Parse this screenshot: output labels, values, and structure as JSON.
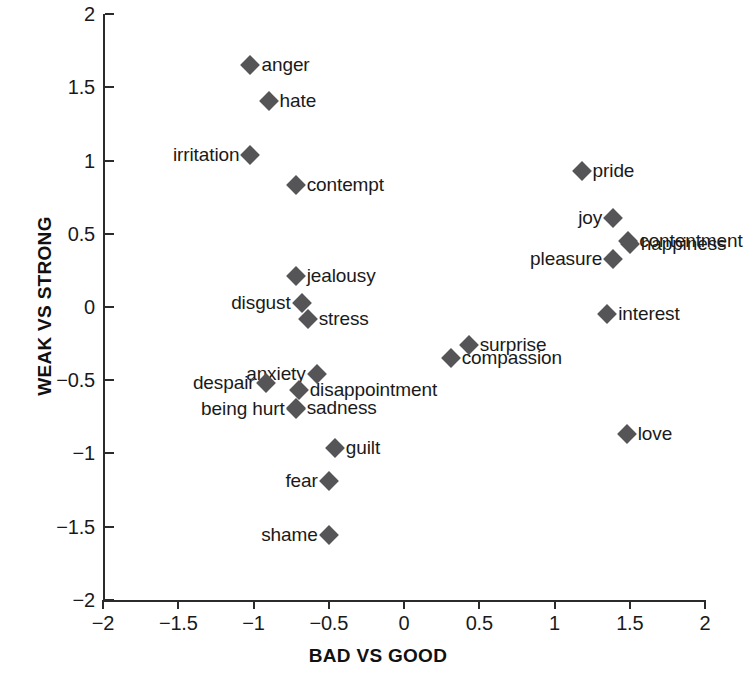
{
  "chart_data": {
    "type": "scatter",
    "title": "",
    "xlabel": "BAD VS GOOD",
    "ylabel": "WEAK VS STRONG",
    "xlim": [
      -2,
      2
    ],
    "ylim": [
      -2,
      2
    ],
    "xticks": [
      "-2",
      "-1.5",
      "-1",
      "-0.5",
      "0",
      "0.5",
      "1",
      "1.5",
      "2"
    ],
    "xtick_values": [
      -2,
      -1.5,
      -1,
      -0.5,
      0,
      0.5,
      1,
      1.5,
      2
    ],
    "yticks": [
      "2",
      "1.5",
      "1",
      "0.5",
      "0",
      "-0.5",
      "-1",
      "-1.5",
      "-2"
    ],
    "ytick_values": [
      2,
      1.5,
      1,
      0.5,
      0,
      -0.5,
      -1,
      -1.5,
      -2
    ],
    "grid": false,
    "legend": "none",
    "marker_shape": "diamond",
    "marker_color": "#555558",
    "points": [
      {
        "label": "anger",
        "x": -1.02,
        "y": 1.65,
        "label_side": "right"
      },
      {
        "label": "hate",
        "x": -0.9,
        "y": 1.41,
        "label_side": "right"
      },
      {
        "label": "irritation",
        "x": -1.02,
        "y": 1.04,
        "label_side": "left"
      },
      {
        "label": "contempt",
        "x": -0.72,
        "y": 0.83,
        "label_side": "right"
      },
      {
        "label": "pride",
        "x": 1.18,
        "y": 0.93,
        "label_side": "right"
      },
      {
        "label": "joy",
        "x": 1.39,
        "y": 0.61,
        "label_side": "left"
      },
      {
        "label": "contentment",
        "x": 1.49,
        "y": 0.45,
        "label_side": "right"
      },
      {
        "label": "happiness",
        "x": 1.5,
        "y": 0.43,
        "label_side": "right"
      },
      {
        "label": "pleasure",
        "x": 1.39,
        "y": 0.33,
        "label_side": "left"
      },
      {
        "label": "interest",
        "x": 1.35,
        "y": -0.05,
        "label_side": "right"
      },
      {
        "label": "jealousy",
        "x": -0.72,
        "y": 0.21,
        "label_side": "right"
      },
      {
        "label": "disgust",
        "x": -0.68,
        "y": 0.03,
        "label_side": "left"
      },
      {
        "label": "stress",
        "x": -0.64,
        "y": -0.08,
        "label_side": "right"
      },
      {
        "label": "surprise",
        "x": 0.43,
        "y": -0.26,
        "label_side": "right"
      },
      {
        "label": "compassion",
        "x": 0.31,
        "y": -0.35,
        "label_side": "right"
      },
      {
        "label": "anxiety",
        "x": -0.58,
        "y": -0.46,
        "label_side": "left"
      },
      {
        "label": "despair",
        "x": -0.92,
        "y": -0.52,
        "label_side": "left"
      },
      {
        "label": "disappointment",
        "x": -0.7,
        "y": -0.57,
        "label_side": "right"
      },
      {
        "label": "sadness",
        "x": -0.72,
        "y": -0.69,
        "label_side": "right"
      },
      {
        "label": "being hurt",
        "x": -0.72,
        "y": -0.7,
        "label_side": "left"
      },
      {
        "label": "guilt",
        "x": -0.46,
        "y": -0.96,
        "label_side": "right"
      },
      {
        "label": "love",
        "x": 1.48,
        "y": -0.87,
        "label_side": "right"
      },
      {
        "label": "fear",
        "x": -0.5,
        "y": -1.19,
        "label_side": "left"
      },
      {
        "label": "shame",
        "x": -0.5,
        "y": -1.56,
        "label_side": "left"
      }
    ]
  }
}
